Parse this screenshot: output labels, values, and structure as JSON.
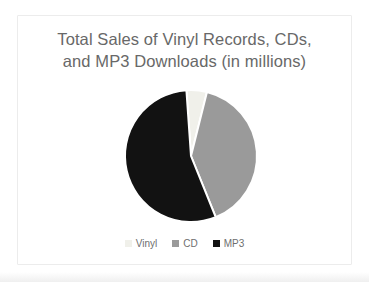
{
  "title": {
    "line1": "Total Sales of Vinyl Records, CDs,",
    "line2": "and MP3 Downloads (in millions)",
    "color": "#686868"
  },
  "legend": {
    "position": "bottom",
    "text_color": "#6e6e6e"
  },
  "chart_data": {
    "type": "pie",
    "title": "Total Sales of Vinyl Records, CDs, and MP3 Downloads (in millions)",
    "labels": [
      "Vinyl",
      "CD",
      "MP3"
    ],
    "values": [
      5,
      40,
      55
    ],
    "values_note": "estimated percent of circle from slice angles; no data labels shown",
    "colors": [
      "#f0f0ea",
      "#9a9a9a",
      "#121212"
    ],
    "start_angle_deg": -4,
    "direction": "clockwise",
    "slice_border_color": "#ffffff",
    "legend_position": "bottom"
  }
}
